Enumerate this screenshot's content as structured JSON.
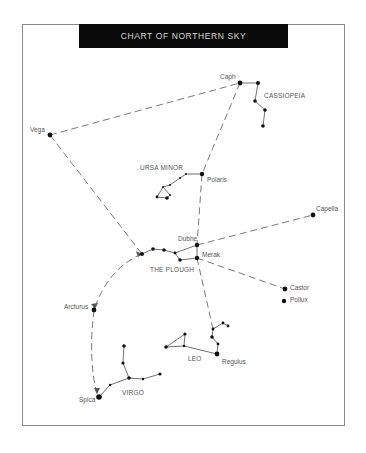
{
  "title": "CHART OF NORTHERN SKY",
  "colors": {
    "background": "#ffffff",
    "title_bar": "#0a0a0a",
    "title_text": "#d8d8d8",
    "star": "#111111",
    "line": "#555555",
    "label": "#555555",
    "frame": "#8a8a8a"
  },
  "stars": [
    {
      "name": "Caph",
      "x": 240,
      "y": 83,
      "size": 2.4
    },
    {
      "name": "Vega",
      "x": 50,
      "y": 135,
      "size": 2.4
    },
    {
      "name": "Polaris",
      "x": 202,
      "y": 174,
      "size": 2.2
    },
    {
      "name": "Dubhe",
      "x": 197,
      "y": 245,
      "size": 2.2
    },
    {
      "name": "Merak",
      "x": 197,
      "y": 258,
      "size": 2.2
    },
    {
      "name": "Capella",
      "x": 313,
      "y": 215,
      "size": 2.4
    },
    {
      "name": "Castor",
      "x": 285,
      "y": 289,
      "size": 2.4
    },
    {
      "name": "Pollux",
      "x": 284,
      "y": 301,
      "size": 2.2
    },
    {
      "name": "Regulus",
      "x": 217,
      "y": 354,
      "size": 2.4
    },
    {
      "name": "Arcturus",
      "x": 94,
      "y": 310,
      "size": 2.4
    },
    {
      "name": "Spica",
      "x": 99,
      "y": 397,
      "size": 2.8
    }
  ],
  "labels": {
    "caph": "Caph",
    "cassiopeia": "CASSIOPEIA",
    "vega": "Vega",
    "ursa_minor": "URSA MINOR",
    "polaris": "Polaris",
    "capella": "Capella",
    "dubhe": "Dubhe",
    "merak": "Merak",
    "the_plough": "THE PLOUGH",
    "castor": "Castor",
    "pollux": "Pollux",
    "arcturus": "Arcturus",
    "leo": "LEO",
    "regulus": "Regulus",
    "virgo": "VIRGO",
    "spica": "Spica"
  },
  "constellations": [
    {
      "name": "CASSIOPEIA",
      "stars": [
        [
          240,
          83
        ],
        [
          258,
          83
        ],
        [
          255,
          101
        ],
        [
          265,
          110
        ],
        [
          263,
          126
        ]
      ]
    },
    {
      "name": "URSA MINOR",
      "stars": [
        [
          202,
          174
        ],
        [
          186,
          174
        ],
        [
          180,
          178
        ],
        [
          170,
          185
        ],
        [
          163,
          187
        ],
        [
          170,
          195
        ],
        [
          157,
          197
        ],
        [
          167,
          198
        ]
      ]
    },
    {
      "name": "THE PLOUGH",
      "stars": [
        [
          142,
          254
        ],
        [
          153,
          249
        ],
        [
          164,
          250
        ],
        [
          175,
          253
        ],
        [
          180,
          260
        ],
        [
          197,
          258
        ],
        [
          197,
          245
        ]
      ]
    },
    {
      "name": "LEO",
      "stars": [
        [
          217,
          354
        ],
        [
          218,
          344
        ],
        [
          212,
          337
        ],
        [
          213,
          329
        ],
        [
          223,
          323
        ],
        [
          228,
          326
        ],
        [
          184,
          346
        ],
        [
          166,
          347
        ],
        [
          185,
          334
        ]
      ]
    },
    {
      "name": "VIRGO",
      "stars": [
        [
          99,
          397
        ],
        [
          110,
          385
        ],
        [
          129,
          378
        ],
        [
          143,
          379
        ],
        [
          160,
          374
        ],
        [
          124,
          346
        ],
        [
          123,
          363
        ]
      ]
    }
  ],
  "guide_lines": [
    {
      "from": "Vega",
      "to": "Caph"
    },
    {
      "from": "Vega",
      "to": "Plough handle"
    },
    {
      "from": "Caph",
      "to": "Dubhe",
      "via": "Polaris"
    },
    {
      "from": "Dubhe",
      "to": "Capella"
    },
    {
      "from": "Merak",
      "to": "Castor"
    },
    {
      "from": "Merak",
      "to": "Regulus"
    },
    {
      "from": "Plough handle",
      "to": "Arcturus"
    },
    {
      "from": "Arcturus",
      "to": "Spica"
    }
  ]
}
